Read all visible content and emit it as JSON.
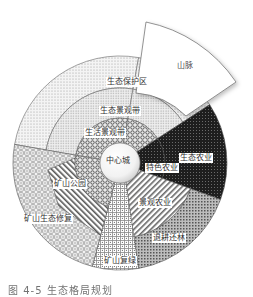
{
  "figure": {
    "type": "concentric sector diagram",
    "center": {
      "label": "中心城"
    },
    "rings": [
      {
        "label": "生活景观带",
        "ring": "inner"
      },
      {
        "label": "生态景观带",
        "ring": "middle"
      },
      {
        "label": "生态保护区",
        "ring": "outer"
      }
    ],
    "sectors": [
      {
        "label": "山脉",
        "kind": "exploded outer wedge"
      },
      {
        "label": "生态农业",
        "kind": "outer"
      },
      {
        "label": "特色农业",
        "kind": "inner"
      },
      {
        "label": "景观农业",
        "kind": "middle"
      },
      {
        "label": "退耕还林",
        "kind": "outer"
      },
      {
        "label": "矿山复绿",
        "kind": "full"
      },
      {
        "label": "矿山公园",
        "kind": "middle"
      },
      {
        "label": "矿山生态修复",
        "kind": "outer"
      }
    ],
    "caption": "图 4-5 生态格局规划"
  },
  "labels": {
    "mountain": "山脉",
    "eco_protect": "生态保护区",
    "eco_landscape": "生态景观带",
    "life_landscape": "生活景观带",
    "center_city": "中心城",
    "eco_agri": "生态农业",
    "special_agri": "特色农业",
    "landscape_agri": "景观农业",
    "reforest": "退耕还林",
    "mine_green": "矿山复绿",
    "mine_park": "矿山公园",
    "mine_restore": "矿山生态修复"
  },
  "colors": {
    "outline": "#555555",
    "background": "#ffffff",
    "dark_sector": "#2a2a2a"
  }
}
